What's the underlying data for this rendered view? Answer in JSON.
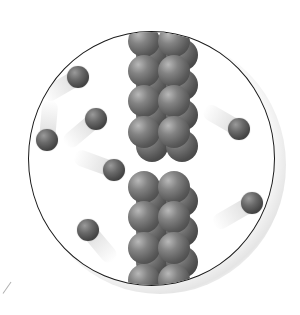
{
  "figure": {
    "lens": {
      "cx": 152,
      "cy": 158,
      "rx": 123,
      "ry": 127,
      "border_color": "#1a1a1a"
    },
    "wall": {
      "columns_x": [
        143,
        173
      ],
      "atom_radius": 16,
      "top_block_rows_y": [
        40,
        70,
        100,
        131
      ],
      "bottom_block_rows_y": [
        186,
        216,
        247,
        279
      ],
      "gap": {
        "y_start": 150,
        "y_end": 168
      },
      "color": "#5a5a5a"
    },
    "particles": [
      {
        "x": 77,
        "y": 76,
        "r": 11,
        "trail_angle": -30,
        "trail_len": 40
      },
      {
        "x": 95,
        "y": 118,
        "r": 11,
        "trail_angle": -40,
        "trail_len": 40
      },
      {
        "x": 46,
        "y": 139,
        "r": 11,
        "trail_angle": 95,
        "trail_len": 40
      },
      {
        "x": 113,
        "y": 169,
        "r": 11,
        "trail_angle": 20,
        "trail_len": 42
      },
      {
        "x": 87,
        "y": 229,
        "r": 11,
        "trail_angle": -130,
        "trail_len": 40
      },
      {
        "x": 238,
        "y": 128,
        "r": 11,
        "trail_angle": 30,
        "trail_len": 40
      },
      {
        "x": 251,
        "y": 202,
        "r": 11,
        "trail_angle": -30,
        "trail_len": 44
      }
    ],
    "particle_color": "#454545"
  }
}
